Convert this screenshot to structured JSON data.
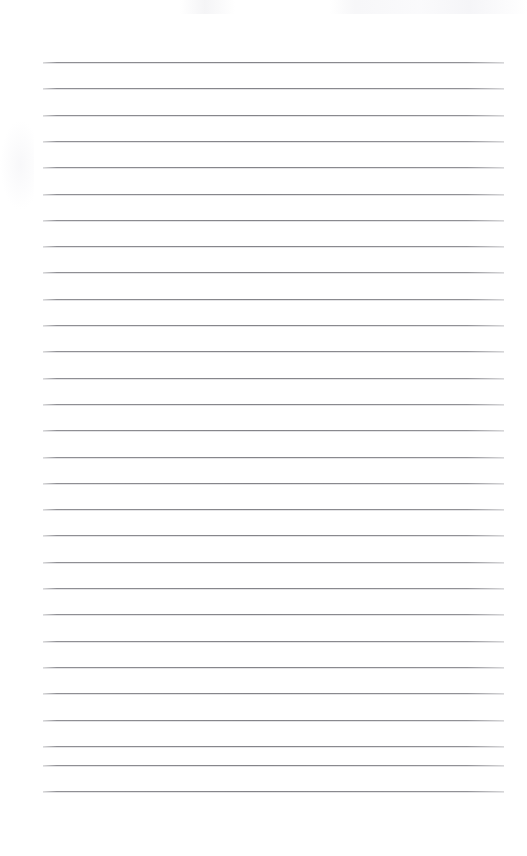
{
  "document": {
    "kind": "blank-lined-paper-scan",
    "title": "",
    "has_text_content": false,
    "header_text": "",
    "body_text": "",
    "footer_text": "",
    "page_number_text": ""
  },
  "page": {
    "width": 527,
    "height": 856,
    "background_color": "#ffffff",
    "top_blank_margin": 55,
    "bottom_blank_margin": 62
  },
  "ruling": {
    "line_color": "#8a8a8f",
    "line_count": 29,
    "line_thickness": 1,
    "first_line_y": 62,
    "line_spacing": 26.3,
    "line_left_x": 43,
    "line_right_x": 504,
    "line_length": 461,
    "lines_y": [
      62,
      88.3,
      114.6,
      140.9,
      167.2,
      193.5,
      219.8,
      246.1,
      272.4,
      298.7,
      325,
      351.3,
      377.6,
      403.9,
      430.2,
      456.5,
      482.8,
      509.1,
      535.4,
      561.7,
      588,
      614.3,
      640.6,
      666.9,
      693.2,
      719.5,
      745.8,
      764.5,
      790.5
    ]
  },
  "annotations": {
    "scan_noise_top_label": "",
    "margin_rule_present": false,
    "holes_present": false
  }
}
